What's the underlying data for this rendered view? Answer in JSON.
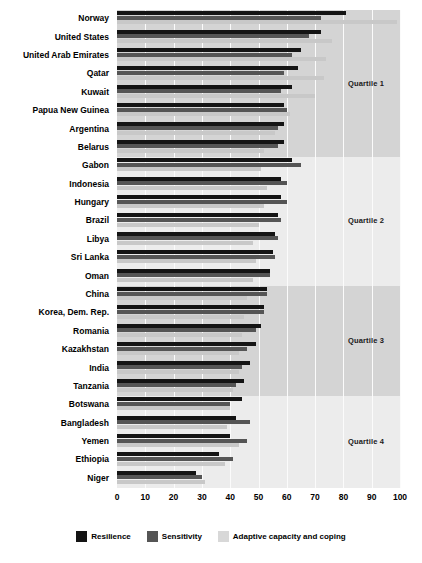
{
  "chart_data": {
    "type": "bar",
    "orientation": "horizontal",
    "title": "",
    "xlabel": "",
    "ylabel": "",
    "xlim": [
      0,
      100
    ],
    "xticks": [
      0,
      10,
      20,
      30,
      40,
      50,
      60,
      70,
      80,
      90,
      100
    ],
    "grid": true,
    "legend_position": "bottom",
    "categories": [
      "Norway",
      "United States",
      "United Arab Emirates",
      "Qatar",
      "Kuwait",
      "Papua New Guinea",
      "Argentina",
      "Belarus",
      "Gabon",
      "Indonesia",
      "Hungary",
      "Brazil",
      "Libya",
      "Sri Lanka",
      "Oman",
      "China",
      "Korea, Dem. Rep.",
      "Romania",
      "Kazakhstan",
      "India",
      "Tanzania",
      "Botswana",
      "Bangladesh",
      "Yemen",
      "Ethiopia",
      "Niger"
    ],
    "series": [
      {
        "name": "Resilience",
        "color": "#141414",
        "values": [
          81,
          72,
          65,
          64,
          62,
          59,
          59,
          59,
          62,
          58,
          58,
          57,
          56,
          55,
          54,
          53,
          52,
          51,
          49,
          47,
          45,
          44,
          42,
          40,
          36,
          28
        ]
      },
      {
        "name": "Sensitivity",
        "color": "#555555",
        "values": [
          72,
          68,
          62,
          59,
          58,
          60,
          57,
          57,
          65,
          60,
          60,
          58,
          57,
          56,
          54,
          53,
          52,
          49,
          46,
          44,
          42,
          40,
          47,
          46,
          41,
          30
        ]
      },
      {
        "name": "Adaptive capacity and coping",
        "color": "#c8c8c8",
        "values": [
          99,
          76,
          74,
          73,
          70,
          61,
          56,
          52,
          51,
          53,
          52,
          50,
          48,
          49,
          48,
          46,
          45,
          44,
          43,
          43,
          41,
          40,
          39,
          43,
          38,
          31
        ]
      }
    ],
    "bands": [
      {
        "label": "Quartile 1",
        "start_index": 0,
        "end_index": 7,
        "shade": "dark"
      },
      {
        "label": "Quartile 2",
        "start_index": 8,
        "end_index": 14,
        "shade": "light"
      },
      {
        "label": "Quartile 3",
        "start_index": 15,
        "end_index": 20,
        "shade": "dark"
      },
      {
        "label": "Quartile 4",
        "start_index": 21,
        "end_index": 25,
        "shade": "light"
      }
    ]
  },
  "legend": {
    "items": [
      {
        "label": "Resilience",
        "swatch": "resilience"
      },
      {
        "label": "Sensitivity",
        "swatch": "sensitivity"
      },
      {
        "label": "Adaptive capacity and coping",
        "swatch": "adaptive"
      }
    ]
  },
  "colors": {
    "resilience": "#141414",
    "sensitivity": "#555555",
    "adaptive": "#c8c8c8",
    "band_dark": "#d4d4d4",
    "band_light": "#ececec",
    "plot_bg": "#e8e8e8",
    "gridline": "#fbfbfb"
  }
}
